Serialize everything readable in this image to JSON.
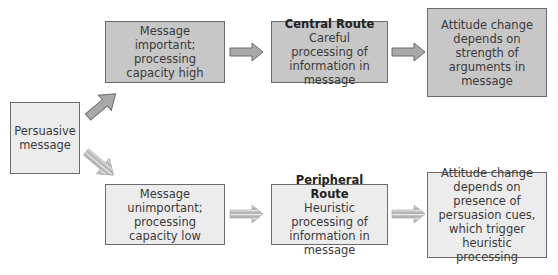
{
  "source": {
    "label": "Persuasive message"
  },
  "central": {
    "condition": "Message important; processing capacity high",
    "route_title": "Central Route",
    "route_desc": "Careful processing of information in message",
    "outcome": "Attitude change depends on strength of arguments in message"
  },
  "peripheral": {
    "condition": "Message unimportant; processing capacity low",
    "route_title": "Peripheral Route",
    "route_desc": "Heuristic processing of information in message",
    "outcome": "Attitude change depends on presence of persuasion cues, which trigger heuristic processing"
  },
  "colors": {
    "dark_box": "#c7c7c7",
    "light_box": "#ececec",
    "border": "#6b6b6b",
    "arrow": "#a9a9a9"
  }
}
